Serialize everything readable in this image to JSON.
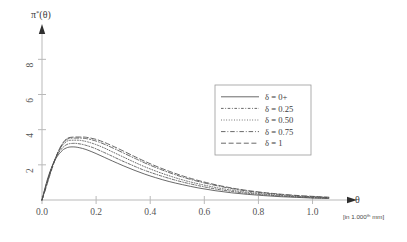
{
  "chart_data": {
    "type": "line",
    "title": "",
    "subtitle": "",
    "xlabel": "θ",
    "xlabel_unit": "[in 1.000ᵗʰ mm]",
    "ylabel": "π*(θ)",
    "ylabel_base": "π",
    "ylabel_sup": "*",
    "ylabel_arg": "(θ)",
    "xlim": [
      0.0,
      1.12
    ],
    "ylim": [
      0,
      9.1
    ],
    "xticks": [
      0.0,
      0.2,
      0.4,
      0.6,
      0.8,
      1.0
    ],
    "xticklabels": [
      "0.0",
      "0.2",
      "0.4",
      "0.6",
      "0.8",
      "1.0"
    ],
    "yticks": [
      2,
      4,
      6,
      8
    ],
    "yticklabels": [
      "2",
      "4",
      "6",
      "8"
    ],
    "grid": false,
    "legend_position": "upper-right-inside",
    "legend_title": "",
    "series": [
      {
        "name": "δ = 0+",
        "linestyle": "solid",
        "peak_x": 0.115,
        "peak_y": 3.02,
        "x": [
          0.0,
          0.01,
          0.02,
          0.03,
          0.04,
          0.05,
          0.06,
          0.07,
          0.08,
          0.09,
          0.1,
          0.115,
          0.13,
          0.15,
          0.17,
          0.2,
          0.23,
          0.26,
          0.3,
          0.34,
          0.38,
          0.42,
          0.47,
          0.52,
          0.58,
          0.64,
          0.7,
          0.76,
          0.82,
          0.88,
          0.94,
          1.0,
          1.06
        ],
        "y": [
          0.0,
          0.62,
          1.17,
          1.63,
          2.01,
          2.32,
          2.56,
          2.74,
          2.88,
          2.96,
          3.01,
          3.02,
          3.0,
          2.93,
          2.83,
          2.64,
          2.43,
          2.22,
          1.95,
          1.7,
          1.47,
          1.27,
          1.05,
          0.87,
          0.68,
          0.53,
          0.41,
          0.32,
          0.25,
          0.19,
          0.15,
          0.11,
          0.09
        ]
      },
      {
        "name": "δ = 0.25",
        "linestyle": "dash-dot-small",
        "peak_x": 0.125,
        "peak_y": 3.22,
        "x": [
          0.0,
          0.01,
          0.02,
          0.03,
          0.04,
          0.05,
          0.06,
          0.07,
          0.08,
          0.09,
          0.1,
          0.115,
          0.125,
          0.14,
          0.16,
          0.19,
          0.22,
          0.25,
          0.29,
          0.33,
          0.37,
          0.42,
          0.47,
          0.52,
          0.58,
          0.64,
          0.7,
          0.76,
          0.82,
          0.88,
          0.94,
          1.0,
          1.06
        ],
        "y": [
          0.0,
          0.58,
          1.12,
          1.6,
          2.02,
          2.37,
          2.65,
          2.87,
          3.03,
          3.14,
          3.2,
          3.22,
          3.22,
          3.19,
          3.12,
          2.97,
          2.77,
          2.56,
          2.27,
          2.0,
          1.74,
          1.47,
          1.23,
          1.02,
          0.81,
          0.63,
          0.49,
          0.38,
          0.3,
          0.23,
          0.18,
          0.13,
          0.1
        ]
      },
      {
        "name": "δ = 0.50",
        "linestyle": "dotted",
        "peak_x": 0.135,
        "peak_y": 3.4,
        "x": [
          0.0,
          0.01,
          0.02,
          0.03,
          0.04,
          0.05,
          0.06,
          0.07,
          0.08,
          0.09,
          0.1,
          0.115,
          0.135,
          0.15,
          0.17,
          0.2,
          0.23,
          0.26,
          0.3,
          0.34,
          0.38,
          0.43,
          0.48,
          0.53,
          0.59,
          0.65,
          0.71,
          0.77,
          0.83,
          0.89,
          0.95,
          1.0,
          1.06
        ],
        "y": [
          0.0,
          0.54,
          1.07,
          1.56,
          2.01,
          2.4,
          2.73,
          2.99,
          3.19,
          3.32,
          3.39,
          3.4,
          3.4,
          3.37,
          3.3,
          3.15,
          2.96,
          2.74,
          2.45,
          2.16,
          1.89,
          1.59,
          1.33,
          1.1,
          0.88,
          0.69,
          0.54,
          0.42,
          0.33,
          0.25,
          0.2,
          0.16,
          0.12
        ]
      },
      {
        "name": "δ = 0.75",
        "linestyle": "dash-dot",
        "peak_x": 0.145,
        "peak_y": 3.52,
        "x": [
          0.0,
          0.01,
          0.02,
          0.03,
          0.04,
          0.05,
          0.06,
          0.07,
          0.08,
          0.09,
          0.1,
          0.12,
          0.145,
          0.16,
          0.18,
          0.21,
          0.24,
          0.27,
          0.31,
          0.35,
          0.39,
          0.44,
          0.49,
          0.54,
          0.6,
          0.66,
          0.72,
          0.78,
          0.84,
          0.9,
          0.96,
          1.01,
          1.06
        ],
        "y": [
          0.0,
          0.5,
          1.02,
          1.51,
          1.97,
          2.39,
          2.75,
          3.05,
          3.27,
          3.42,
          3.5,
          3.52,
          3.52,
          3.5,
          3.44,
          3.3,
          3.11,
          2.9,
          2.61,
          2.32,
          2.04,
          1.73,
          1.45,
          1.21,
          0.97,
          0.77,
          0.6,
          0.47,
          0.37,
          0.29,
          0.22,
          0.18,
          0.14
        ]
      },
      {
        "name": "δ = 1",
        "linestyle": "dashed",
        "peak_x": 0.155,
        "peak_y": 3.58,
        "x": [
          0.0,
          0.01,
          0.02,
          0.03,
          0.04,
          0.05,
          0.06,
          0.07,
          0.08,
          0.09,
          0.1,
          0.12,
          0.14,
          0.155,
          0.17,
          0.2,
          0.23,
          0.26,
          0.3,
          0.34,
          0.38,
          0.43,
          0.48,
          0.53,
          0.59,
          0.65,
          0.71,
          0.77,
          0.83,
          0.89,
          0.95,
          1.01,
          1.06
        ],
        "y": [
          0.0,
          0.46,
          0.96,
          1.45,
          1.92,
          2.35,
          2.74,
          3.06,
          3.31,
          3.47,
          3.55,
          3.58,
          3.58,
          3.58,
          3.55,
          3.45,
          3.28,
          3.08,
          2.79,
          2.49,
          2.2,
          1.87,
          1.58,
          1.32,
          1.06,
          0.84,
          0.66,
          0.52,
          0.41,
          0.32,
          0.25,
          0.2,
          0.16
        ]
      }
    ]
  },
  "legend": {
    "entries": [
      {
        "label": "δ = 0+"
      },
      {
        "label": "δ = 0.25"
      },
      {
        "label": "δ = 0.50"
      },
      {
        "label": "δ = 0.75"
      },
      {
        "label": "δ = 1"
      }
    ]
  },
  "axes": {
    "x_title": "θ",
    "x_unit": "[in 1.000ᵗʰ mm]",
    "y_title_base": "π",
    "y_title_sup": "*",
    "y_title_arg": "(θ)",
    "x_tick_labels": [
      "0.0",
      "0.2",
      "0.4",
      "0.6",
      "0.8",
      "1.0"
    ],
    "y_tick_labels": [
      "2",
      "4",
      "6",
      "8"
    ]
  },
  "colors": {
    "axis": "#b9b9b9",
    "curve": "#4e4e4e",
    "text": "#3a3a3a",
    "tick_text": "#555555",
    "legend_border": "#9a9a9a",
    "background": "#ffffff"
  }
}
